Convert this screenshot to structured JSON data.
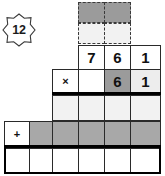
{
  "worksheet": {
    "badge": {
      "icon": "star-burst-icon",
      "value": "12"
    },
    "operators": {
      "multiply": "×",
      "plus": "+"
    },
    "colors": {
      "dark_gray": "#9b9b9b",
      "mid_gray": "#a8a8a8",
      "light_gray": "#ededed",
      "pale_gray": "#f2f2f2",
      "white": "#ffffff",
      "ink": "#111111",
      "rule": "#000000"
    },
    "carry_row": {
      "label": "carry-boxes-dashed",
      "cells": [
        {
          "id": "carry-top-left",
          "value": "",
          "fill": "dark",
          "border": "dashed"
        },
        {
          "id": "carry-top-right",
          "value": "",
          "fill": "dark",
          "border": "dashed"
        },
        {
          "id": "carry-bot-left",
          "value": "",
          "fill": "pale",
          "border": "dashed"
        },
        {
          "id": "carry-bot-right",
          "value": "",
          "fill": "pale",
          "border": "dashed"
        }
      ]
    },
    "rows": [
      {
        "id": "multiplicand-row",
        "cells": [
          {
            "id": "multiplicand-hundreds",
            "value": "7",
            "fill": "white"
          },
          {
            "id": "multiplicand-tens",
            "value": "6",
            "fill": "white"
          },
          {
            "id": "multiplicand-ones",
            "value": "1",
            "fill": "white"
          }
        ]
      },
      {
        "id": "multiplier-row",
        "cells": [
          {
            "id": "multiply-operator",
            "value": "×",
            "fill": "white"
          },
          {
            "id": "multiplier-blank",
            "value": "",
            "fill": "white"
          },
          {
            "id": "multiplier-tens",
            "value": "6",
            "fill": "dark"
          },
          {
            "id": "multiplier-ones",
            "value": "1",
            "fill": "light"
          }
        ]
      },
      {
        "id": "partial-product-row-1",
        "cells": [
          {
            "id": "partial1-c1",
            "value": "",
            "fill": "pale"
          },
          {
            "id": "partial1-c2",
            "value": "",
            "fill": "pale"
          },
          {
            "id": "partial1-c3",
            "value": "",
            "fill": "pale"
          },
          {
            "id": "partial1-c4",
            "value": "",
            "fill": "pale"
          }
        ]
      },
      {
        "id": "partial-product-row-2",
        "cells": [
          {
            "id": "plus-operator",
            "value": "+",
            "fill": "white"
          },
          {
            "id": "partial2-c1",
            "value": "",
            "fill": "mid"
          },
          {
            "id": "partial2-c2",
            "value": "",
            "fill": "mid"
          },
          {
            "id": "partial2-c3",
            "value": "",
            "fill": "mid"
          },
          {
            "id": "partial2-c4",
            "value": "",
            "fill": "mid"
          },
          {
            "id": "partial2-c5",
            "value": "",
            "fill": "mid"
          }
        ]
      },
      {
        "id": "answer-row",
        "cells": [
          {
            "id": "answer-c1",
            "value": "",
            "fill": "white"
          },
          {
            "id": "answer-c2",
            "value": "",
            "fill": "white"
          },
          {
            "id": "answer-c3",
            "value": "",
            "fill": "white"
          },
          {
            "id": "answer-c4",
            "value": "",
            "fill": "white"
          },
          {
            "id": "answer-c5",
            "value": "",
            "fill": "white"
          },
          {
            "id": "answer-c6",
            "value": "",
            "fill": "white"
          }
        ]
      }
    ]
  }
}
